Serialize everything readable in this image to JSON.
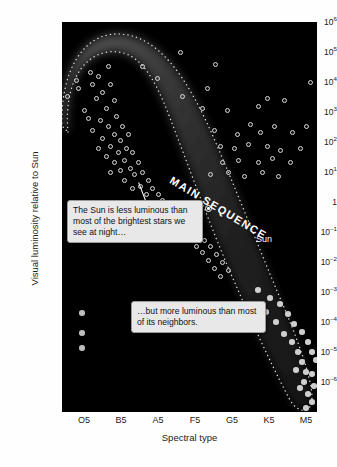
{
  "chart_data": {
    "type": "scatter",
    "title": "",
    "xlabel": "Spectral type",
    "ylabel": "Visual luminosity relative to Sun",
    "grid": false,
    "legend": "none",
    "background": "#000000",
    "xtick_labels": [
      "O5",
      "B5",
      "A5",
      "F5",
      "G5",
      "K5",
      "M5"
    ],
    "ytick_labels": [
      "10⁶",
      "10⁵",
      "10⁴",
      "10³",
      "10²",
      "10¹",
      "1",
      "10⁻¹",
      "10⁻²",
      "10⁻³",
      "10⁻⁴",
      "10⁻⁵",
      "10⁻⁶"
    ],
    "ytick_bases": [
      "10",
      "10",
      "10",
      "10",
      "10",
      "10",
      "1",
      "10",
      "10",
      "10",
      "10",
      "10",
      "10"
    ],
    "ytick_exponents": [
      "6",
      "5",
      "4",
      "3",
      "2",
      "1",
      "",
      "−1",
      "−2",
      "−3",
      "−4",
      "−5",
      "−6"
    ],
    "ylim": [
      -6,
      6
    ],
    "xlim": [
      "O5",
      "M5"
    ],
    "annotations": [
      {
        "name": "main-sequence-band-label",
        "text": "MAIN SEQUENCE",
        "rotation_deg": 31
      },
      {
        "name": "sun-point-label",
        "text": "Sun",
        "x": "G2",
        "y_log": 0
      },
      {
        "name": "callout-brightest-stars",
        "text": "The Sun is less luminous than most of the brightest stars we see at night…"
      },
      {
        "name": "callout-neighbors",
        "text": "…but more luminous than most of its neighbors."
      }
    ],
    "series": [
      {
        "name": "main-sequence-stars",
        "marker": "open-circle",
        "color": "#d8d8d8",
        "points": [
          [
            14,
            58
          ],
          [
            5,
            74
          ],
          [
            28,
            50
          ],
          [
            46,
            44
          ],
          [
            16,
            66
          ],
          [
            30,
            62
          ],
          [
            36,
            54
          ],
          [
            22,
            88
          ],
          [
            40,
            70
          ],
          [
            48,
            62
          ],
          [
            34,
            76
          ],
          [
            44,
            86
          ],
          [
            52,
            78
          ],
          [
            26,
            96
          ],
          [
            38,
            98
          ],
          [
            30,
            108
          ],
          [
            46,
            104
          ],
          [
            54,
            94
          ],
          [
            40,
            116
          ],
          [
            52,
            112
          ],
          [
            48,
            124
          ],
          [
            58,
            118
          ],
          [
            36,
            126
          ],
          [
            60,
            104
          ],
          [
            66,
            112
          ],
          [
            56,
            130
          ],
          [
            64,
            126
          ],
          [
            44,
            134
          ],
          [
            52,
            140
          ],
          [
            62,
            138
          ],
          [
            70,
            130
          ],
          [
            58,
            148
          ],
          [
            68,
            146
          ],
          [
            48,
            150
          ],
          [
            76,
            140
          ],
          [
            72,
            152
          ],
          [
            62,
            158
          ],
          [
            80,
            150
          ],
          [
            86,
            158
          ],
          [
            78,
            164
          ],
          [
            70,
            166
          ],
          [
            90,
            166
          ],
          [
            84,
            172
          ],
          [
            96,
            172
          ],
          [
            92,
            180
          ],
          [
            100,
            178
          ],
          [
            106,
            184
          ],
          [
            88,
            186
          ],
          [
            112,
            188
          ],
          [
            102,
            192
          ],
          [
            118,
            194
          ],
          [
            110,
            200
          ],
          [
            124,
            200
          ],
          [
            116,
            206
          ],
          [
            130,
            206
          ],
          [
            122,
            212
          ],
          [
            136,
            212
          ],
          [
            128,
            218
          ],
          [
            142,
            218
          ],
          [
            134,
            224
          ],
          [
            148,
            224
          ],
          [
            140,
            230
          ],
          [
            154,
            232
          ],
          [
            146,
            238
          ],
          [
            160,
            240
          ],
          [
            152,
            246
          ],
          [
            166,
            248
          ],
          [
            158,
            254
          ]
        ]
      },
      {
        "name": "giant-and-supergiant-stars",
        "marker": "open-circle",
        "color": "#d8d8d8",
        "points": [
          [
            118,
            30
          ],
          [
            80,
            44
          ],
          [
            95,
            56
          ],
          [
            145,
            66
          ],
          [
            120,
            74
          ],
          [
            153,
            42
          ],
          [
            248,
            60
          ],
          [
            140,
            86
          ],
          [
            165,
            88
          ],
          [
            205,
            76
          ],
          [
            196,
            84
          ],
          [
            222,
            78
          ],
          [
            188,
            102
          ],
          [
            152,
            108
          ],
          [
            175,
            112
          ],
          [
            198,
            110
          ],
          [
            212,
            104
          ],
          [
            230,
            110
          ],
          [
            244,
            104
          ],
          [
            158,
            124
          ],
          [
            172,
            126
          ],
          [
            186,
            122
          ],
          [
            205,
            124
          ],
          [
            218,
            128
          ],
          [
            238,
            126
          ],
          [
            160,
            140
          ],
          [
            176,
            138
          ],
          [
            196,
            140
          ],
          [
            210,
            136
          ],
          [
            228,
            140
          ],
          [
            148,
            152
          ],
          [
            166,
            150
          ],
          [
            182,
            154
          ],
          [
            200,
            150
          ],
          [
            216,
            154
          ]
        ]
      },
      {
        "name": "red-dwarf-stars",
        "marker": "filled-circle",
        "color": "#cfcfcf",
        "points": [
          [
            196,
            268
          ],
          [
            208,
            276
          ],
          [
            218,
            282
          ],
          [
            204,
            290
          ],
          [
            226,
            292
          ],
          [
            214,
            300
          ],
          [
            232,
            302
          ],
          [
            222,
            312
          ],
          [
            240,
            310
          ],
          [
            230,
            320
          ],
          [
            246,
            320
          ],
          [
            236,
            330
          ],
          [
            250,
            330
          ],
          [
            240,
            340
          ],
          [
            254,
            338
          ],
          [
            244,
            350
          ],
          [
            234,
            348
          ],
          [
            250,
            352
          ],
          [
            242,
            360
          ],
          [
            252,
            364
          ],
          [
            246,
            372
          ],
          [
            238,
            366
          ],
          [
            250,
            380
          ],
          [
            244,
            386
          ]
        ]
      },
      {
        "name": "white-dwarf-stars",
        "marker": "filled-circle",
        "color": "#bdbdbd",
        "points": [
          [
            20,
            291
          ],
          [
            20,
            311
          ],
          [
            20,
            326
          ]
        ]
      },
      {
        "name": "the-sun",
        "marker": "circle-with-dot",
        "color": "#ffffff",
        "points": [
          [
            145,
            185
          ]
        ]
      }
    ]
  }
}
